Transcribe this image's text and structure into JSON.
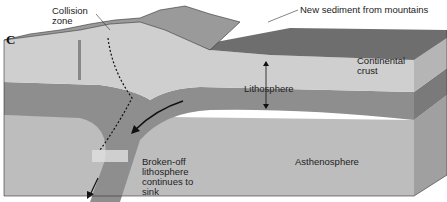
{
  "diagram": {
    "panel_letter": "C",
    "labels": {
      "collision_zone": "Collision\nzone",
      "new_sediment": "New sediment from mountains",
      "continental_crust": "Continental\ncrust",
      "lithosphere": "Lithosphere",
      "asthenosphere": "Asthenosphere",
      "broken_off": "Broken-off\nlithosphere\ncontinues to\nsink"
    },
    "colors": {
      "crust": "#cfcfcf",
      "mountains": "#9a9a9a",
      "sediment": "#6e6e6e",
      "lithosphere": "#8e8e8e",
      "asthenosphere": "#bdbdbd",
      "side_face": "#a8a8a8"
    }
  }
}
